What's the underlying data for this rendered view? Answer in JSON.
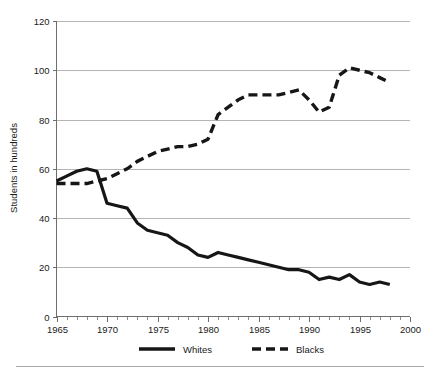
{
  "chart_data": {
    "type": "line",
    "title": "",
    "xlabel": "",
    "ylabel": "Students in hundreds",
    "xlim": [
      1965,
      2000
    ],
    "ylim": [
      0,
      120
    ],
    "grid": true,
    "legend_position": "bottom",
    "y_ticks": [
      0,
      20,
      40,
      60,
      80,
      100,
      120
    ],
    "y_tick_labels": [
      "0",
      "20",
      "40",
      "60",
      "80",
      "100",
      "120"
    ],
    "x_ticks": [
      1965,
      1970,
      1975,
      1980,
      1985,
      1990,
      1995,
      2000
    ],
    "x_tick_labels": [
      "1965",
      "1970",
      "1975",
      "1980",
      "1985",
      "1990",
      "1995",
      "2000"
    ],
    "x_minor_tick_step": 1,
    "x": [
      1965,
      1966,
      1967,
      1968,
      1969,
      1970,
      1971,
      1972,
      1973,
      1974,
      1975,
      1976,
      1977,
      1978,
      1979,
      1980,
      1981,
      1982,
      1983,
      1984,
      1985,
      1986,
      1987,
      1988,
      1989,
      1990,
      1991,
      1992,
      1993,
      1994,
      1995,
      1996,
      1997,
      1998
    ],
    "series": [
      {
        "name": "Whites",
        "style": "solid",
        "color": "#161616",
        "values": [
          55,
          57,
          59,
          60,
          59,
          46,
          45,
          44,
          38,
          35,
          34,
          33,
          30,
          28,
          25,
          24,
          26,
          25,
          24,
          23,
          22,
          21,
          20,
          19,
          19,
          18,
          15,
          16,
          15,
          17,
          14,
          13,
          14,
          13
        ]
      },
      {
        "name": "Blacks",
        "style": "dashed",
        "color": "#161616",
        "values": [
          54,
          54,
          54,
          54,
          55,
          56,
          58,
          60,
          63,
          65,
          67,
          68,
          69,
          69,
          70,
          72,
          82,
          85,
          88,
          90,
          90,
          90,
          90,
          91,
          92,
          88,
          83,
          85,
          98,
          101,
          100,
          99,
          97,
          95
        ]
      }
    ]
  },
  "legend": {
    "items": [
      {
        "label": "Whites",
        "style": "solid"
      },
      {
        "label": "Blacks",
        "style": "dashed"
      }
    ]
  }
}
